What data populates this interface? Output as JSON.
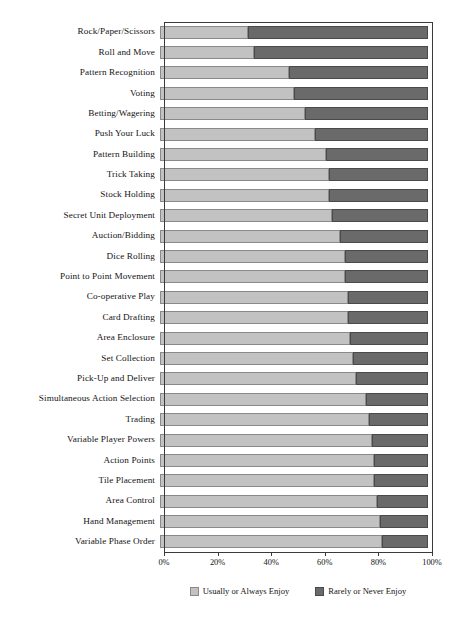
{
  "chart_data": {
    "type": "bar",
    "orientation": "horizontal",
    "stacked": true,
    "normalized": true,
    "title": "",
    "subtitle": "",
    "xlabel": "",
    "ylabel": "",
    "xlim": [
      0,
      100
    ],
    "grid": false,
    "legend_position": "bottom-center",
    "xticks": [
      0,
      20,
      40,
      60,
      80,
      100
    ],
    "xtick_labels": [
      "0%",
      "20%",
      "40%",
      "60%",
      "80%",
      "100%"
    ],
    "categories": [
      "Rock/Paper/Scissors",
      "Roll and Move",
      "Pattern Recognition",
      "Voting",
      "Betting/Wagering",
      "Push Your Luck",
      "Pattern Building",
      "Trick Taking",
      "Stock Holding",
      "Secret Unit Deployment",
      "Auction/Bidding",
      "Dice Rolling",
      "Point to Point Movement",
      "Co-operative Play",
      "Card Drafting",
      "Area Enclosure",
      "Set Collection",
      "Pick-Up and Deliver",
      "Simultaneous Action Selection",
      "Trading",
      "Variable Player Powers",
      "Action Points",
      "Tile Placement",
      "Area Control",
      "Hand Management",
      "Variable Phase Order"
    ],
    "series": [
      {
        "name": "Usually or Always Enjoy",
        "color": "#c2c2c2",
        "values": [
          33,
          35,
          48,
          50,
          54,
          58,
          62,
          63,
          63,
          64,
          67,
          69,
          69,
          70,
          70,
          71,
          72,
          73,
          77,
          78,
          79,
          80,
          80,
          81,
          82,
          83
        ]
      },
      {
        "name": "Rarely or Never Enjoy",
        "color": "#6a6a6a",
        "values": [
          67,
          65,
          52,
          50,
          46,
          42,
          38,
          37,
          37,
          36,
          33,
          31,
          31,
          30,
          30,
          29,
          28,
          27,
          23,
          22,
          21,
          20,
          20,
          19,
          18,
          17
        ]
      }
    ]
  },
  "legend": {
    "items": [
      {
        "label": "Usually or Always Enjoy",
        "color": "#c2c2c2"
      },
      {
        "label": "Rarely or Never Enjoy",
        "color": "#6a6a6a"
      }
    ]
  }
}
